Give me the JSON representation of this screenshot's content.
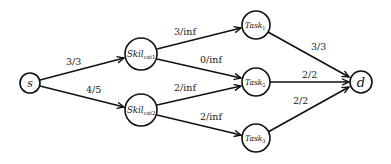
{
  "diagram": {
    "type": "flow-network",
    "nodes": {
      "s": {
        "label": "s",
        "sub": ""
      },
      "skil1": {
        "label": "Skil",
        "sub": "cat1"
      },
      "skil2": {
        "label": "Skil",
        "sub": "cat2"
      },
      "task1": {
        "label": "Task",
        "sub": "1"
      },
      "task2": {
        "label": "Task",
        "sub": "2"
      },
      "task3": {
        "label": "Task",
        "sub": "3"
      },
      "d": {
        "label": "d",
        "sub": ""
      }
    },
    "edges": [
      {
        "from": "s",
        "to": "skil1",
        "label": "3/3"
      },
      {
        "from": "s",
        "to": "skil2",
        "label": "4/5"
      },
      {
        "from": "skil1",
        "to": "task1",
        "label": "3/inf"
      },
      {
        "from": "skil1",
        "to": "task2",
        "label": "0/inf"
      },
      {
        "from": "skil2",
        "to": "task2",
        "label": "2/inf"
      },
      {
        "from": "skil2",
        "to": "task3",
        "label": "2/inf"
      },
      {
        "from": "task1",
        "to": "d",
        "label": "3/3"
      },
      {
        "from": "task2",
        "to": "d",
        "label": "2/2"
      },
      {
        "from": "task3",
        "to": "d",
        "label": "2/2"
      }
    ]
  }
}
